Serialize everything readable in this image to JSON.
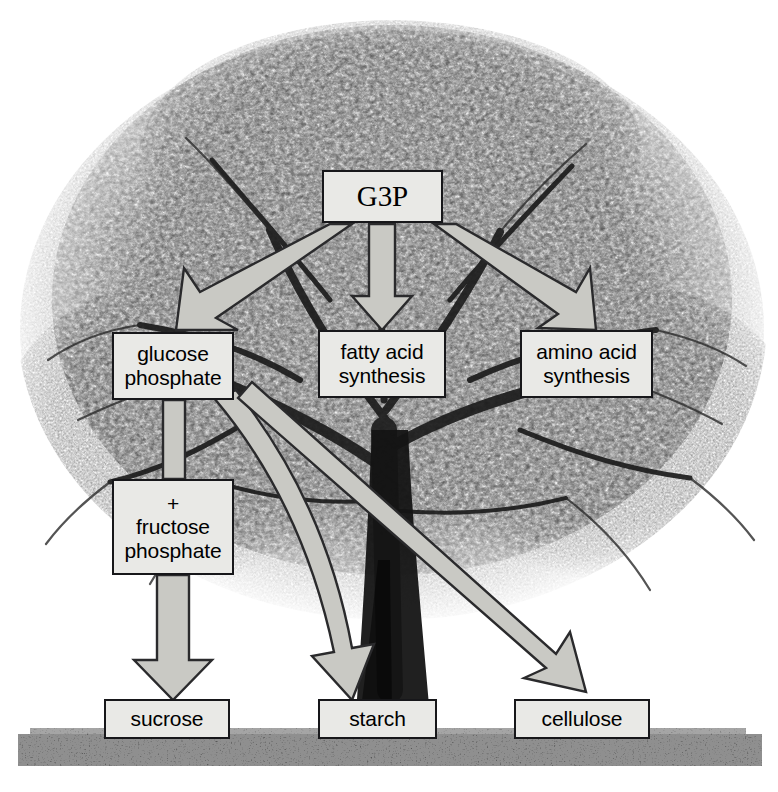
{
  "diagram": {
    "background_image": "grayscale-tree-photograph",
    "colors": {
      "box_fill": "#e9e9e6",
      "box_border": "#17171a",
      "arrow_fill": "#c9c9c4",
      "arrow_stroke": "#2a2a2c",
      "text": "#000000",
      "ground": "#3d3d3d",
      "page_background": "#ffffff"
    },
    "nodes": [
      {
        "id": "g3p",
        "label": "G3P",
        "lines": [
          "G3P"
        ]
      },
      {
        "id": "glucose",
        "label": "glucose phosphate",
        "lines": [
          "glucose",
          "phosphate"
        ]
      },
      {
        "id": "fatty",
        "label": "fatty acid synthesis",
        "lines": [
          "fatty acid",
          "synthesis"
        ]
      },
      {
        "id": "amino",
        "label": "amino acid synthesis",
        "lines": [
          "amino acid",
          "synthesis"
        ]
      },
      {
        "id": "fructose",
        "label": "+ fructose phosphate",
        "lines": [
          "+",
          "fructose",
          "phosphate"
        ]
      },
      {
        "id": "sucrose",
        "label": "sucrose",
        "lines": [
          "sucrose"
        ]
      },
      {
        "id": "starch",
        "label": "starch",
        "lines": [
          "starch"
        ]
      },
      {
        "id": "cellulose",
        "label": "cellulose",
        "lines": [
          "cellulose"
        ]
      }
    ],
    "edges": [
      {
        "from": "g3p",
        "to": "glucose",
        "style": "block-arrow",
        "direction": "down-left"
      },
      {
        "from": "g3p",
        "to": "fatty",
        "style": "block-arrow",
        "direction": "down"
      },
      {
        "from": "g3p",
        "to": "amino",
        "style": "block-arrow",
        "direction": "down-right"
      },
      {
        "from": "glucose",
        "to": "fructose",
        "style": "plain-connector",
        "direction": "down"
      },
      {
        "from": "fructose",
        "to": "sucrose",
        "style": "block-arrow",
        "direction": "down"
      },
      {
        "from": "glucose",
        "to": "starch",
        "style": "block-arrow",
        "direction": "down-bend"
      },
      {
        "from": "glucose",
        "to": "cellulose",
        "style": "block-arrow",
        "direction": "down-right"
      }
    ]
  }
}
